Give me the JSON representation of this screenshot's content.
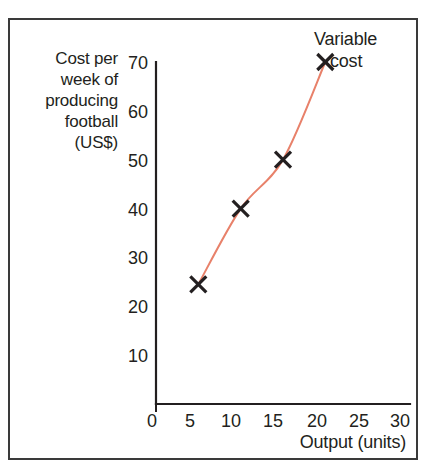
{
  "figure": {
    "background_color": "#ffffff",
    "frame_color": "#3a3a3a",
    "axis_color": "#231f20",
    "curve_color": "#E8816A",
    "marker_color": "#231f20"
  },
  "legend": {
    "line1": "Variable",
    "line2": "cost",
    "marker_icon": "x-marker-icon"
  },
  "chart_data": {
    "type": "line",
    "title": "",
    "subtitle": "",
    "xlabel": "Output (units)",
    "ylabel": "Cost per week of\nproducing\nfootball\n(US$)",
    "ylabel_lines": [
      "Cost per",
      "week of",
      "producing",
      "football",
      "(US$)"
    ],
    "xlim": [
      0,
      30
    ],
    "ylim": [
      0,
      70
    ],
    "xticks": [
      0,
      5,
      10,
      15,
      20,
      25,
      30
    ],
    "yticks": [
      0,
      10,
      20,
      30,
      40,
      50,
      60,
      70
    ],
    "xtick_labels": [
      "0",
      "5",
      "10",
      "15",
      "20",
      "25",
      "30"
    ],
    "ytick_labels": [
      "0",
      "10",
      "20",
      "30",
      "40",
      "50",
      "60",
      "70"
    ],
    "grid": false,
    "legend_position": "top-right",
    "series": [
      {
        "name": "Variable cost",
        "color": "#E8816A",
        "marker": "x",
        "marker_color": "#231f20",
        "x": [
          5,
          10,
          15,
          20
        ],
        "values": [
          24.5,
          40,
          50,
          70
        ],
        "points": [
          {
            "x": 5,
            "y": 24.5
          },
          {
            "x": 10,
            "y": 40
          },
          {
            "x": 15,
            "y": 50
          },
          {
            "x": 20,
            "y": 70
          }
        ]
      }
    ],
    "annotations": [
      {
        "text": "Variable cost",
        "target_point": {
          "x": 20,
          "y": 70
        },
        "position": "top-right"
      }
    ]
  }
}
